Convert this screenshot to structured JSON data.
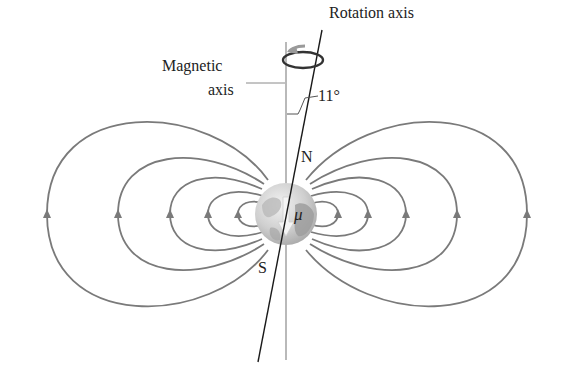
{
  "diagram": {
    "labels": {
      "rotation_axis": "Rotation axis",
      "magnetic_axis_line1": "Magnetic",
      "magnetic_axis_line2": "axis",
      "angle": "11°",
      "north": "N",
      "south": "S",
      "moment": "μ"
    },
    "colors": {
      "field_lines": "#7a7a7a",
      "axes": "#1a1a1a",
      "magnetic_axis": "#8a8a8a",
      "globe_light": "#e6e6e6",
      "globe_dark": "#9a9a9a",
      "text": "#222222"
    },
    "tilt_degrees": 11
  }
}
